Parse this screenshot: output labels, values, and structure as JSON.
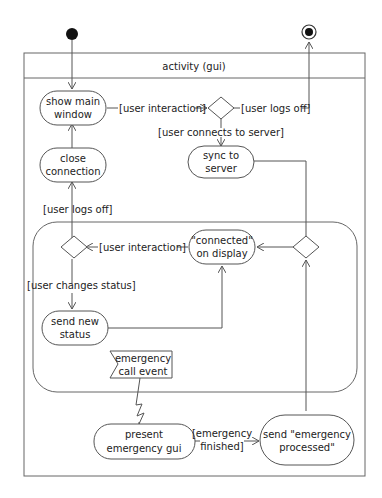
{
  "diagram": {
    "type": "uml-activity",
    "frame_title": "activity (gui)",
    "nodes": {
      "show_main_window": [
        "show main",
        "window"
      ],
      "close_connection": [
        "close",
        "connection"
      ],
      "sync_to_server": [
        "sync to",
        "server"
      ],
      "connected_on_display": [
        "\"connected\"",
        "on display"
      ],
      "send_new_status": [
        "send new",
        "status"
      ],
      "emergency_call_event": [
        "emergency",
        "call event"
      ],
      "present_emergency_gui": [
        "present",
        "emergency gui"
      ],
      "send_emergency_processed": [
        "send \"emergency",
        "processed\""
      ]
    },
    "guards": {
      "user_interaction_top": "[user interaction]",
      "user_logs_off_top": "[user logs off]",
      "user_connects": "[user connects to server]",
      "user_logs_off_left": "[user logs off]",
      "user_interaction_mid": "[user interaction]",
      "user_changes_status": "[user changes status]",
      "emergency_finished": [
        "[emergency",
        "finished]"
      ]
    }
  }
}
